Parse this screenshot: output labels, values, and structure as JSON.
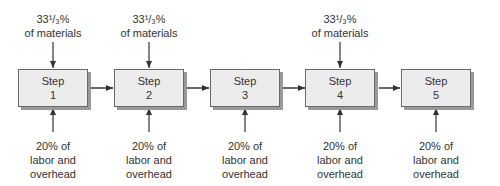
{
  "steps": [
    {
      "label": "Step",
      "number": "1"
    },
    {
      "label": "Step",
      "number": "2"
    },
    {
      "label": "Step",
      "number": "3"
    },
    {
      "label": "Step",
      "number": "4"
    },
    {
      "label": "Step",
      "number": "5"
    }
  ],
  "materials": {
    "line1": "33¹/₃%",
    "line2": "of materials",
    "applies_to_steps": [
      1,
      2,
      4
    ]
  },
  "labor": {
    "line1": "20% of",
    "line2": "labor and",
    "line3": "overhead",
    "applies_to_steps": [
      1,
      2,
      3,
      4,
      5
    ]
  }
}
